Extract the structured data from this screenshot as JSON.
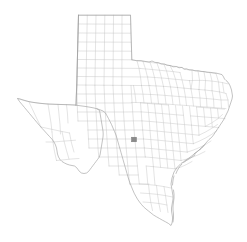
{
  "figure": {
    "background_color": "#ffffff",
    "width": 247,
    "height": 242
  },
  "map": {
    "name": "texas-county-map",
    "region": "Texas",
    "subdivision_type": "county",
    "county_count": 254,
    "boundary_color": "#c3c3c3",
    "outline_color": "#9a9a9a",
    "fill_color": "#ffffff",
    "highlight_color": "#8a8a8a",
    "projection_bounds": {
      "left_px": 17,
      "right_px": 233,
      "top_px": 15,
      "bottom_px": 226
    },
    "highlights": [
      {
        "name": "highlighted-county",
        "center_x": 134,
        "center_y": 139.5,
        "width": 5.0,
        "height": 4.6,
        "color": "#8a8a8a"
      }
    ],
    "regions": [
      {
        "name": "panhandle",
        "note": "regular rectangular county grid"
      },
      {
        "name": "west-texas",
        "note": "large sparse counties"
      },
      {
        "name": "central-texas",
        "note": "dense irregular counties"
      },
      {
        "name": "east-texas",
        "note": "dense irregular counties"
      },
      {
        "name": "gulf-coast",
        "note": "coastline with barrier islands"
      },
      {
        "name": "south-texas",
        "note": "rio grande valley"
      }
    ]
  }
}
